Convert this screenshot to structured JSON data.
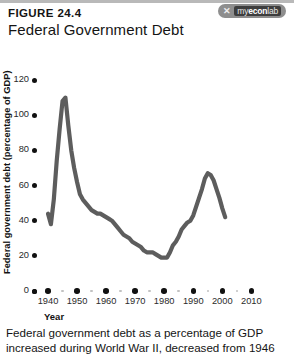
{
  "header": {
    "figure_number": "FIGURE 24.4",
    "title": "Federal Government Debt",
    "logo_mark": "✕",
    "logo_my": "my",
    "logo_econ": "econ",
    "logo_lab": "lab"
  },
  "caption": {
    "line1": "Federal government debt as a percentage of GDP",
    "line2": "increased during World War II, decreased from 1946"
  },
  "chart_data": {
    "type": "line",
    "title": "Federal Government Debt",
    "xlabel": "Year",
    "ylabel": "Federal government debt (percentage of GDP)",
    "xlim": [
      1940,
      2010
    ],
    "ylim": [
      0,
      120
    ],
    "xticks": [
      "1940",
      "1950",
      "1960",
      "1970",
      "1980",
      "1990",
      "2000",
      "2010"
    ],
    "yticks": [
      "0",
      "20",
      "40",
      "60",
      "80",
      "100",
      "120"
    ],
    "grid": false,
    "legend": "none",
    "line_color": "#5d5d5d",
    "series": [
      {
        "name": "Federal government debt (percentage of GDP)",
        "x": [
          1940,
          1941,
          1942,
          1943,
          1944,
          1945,
          1946,
          1947,
          1948,
          1949,
          1950,
          1951,
          1952,
          1953,
          1954,
          1955,
          1956,
          1957,
          1958,
          1959,
          1960,
          1961,
          1962,
          1963,
          1964,
          1965,
          1966,
          1967,
          1968,
          1969,
          1970,
          1971,
          1972,
          1973,
          1974,
          1975,
          1976,
          1977,
          1978,
          1979,
          1980,
          1981,
          1982,
          1983,
          1984,
          1985,
          1986,
          1987,
          1988,
          1989,
          1990,
          1991,
          1992,
          1993,
          1994,
          1995,
          1996,
          1997,
          1998,
          1999,
          2000,
          2001
        ],
        "values": [
          44,
          38,
          52,
          74,
          92,
          108,
          110,
          94,
          80,
          70,
          62,
          55,
          52,
          50,
          48,
          46,
          45,
          44,
          44,
          43,
          42,
          41,
          40,
          38,
          36,
          34,
          32,
          31,
          30,
          28,
          27,
          26,
          25,
          23,
          22,
          22,
          22,
          21,
          20,
          19,
          19,
          19,
          22,
          26,
          28,
          31,
          35,
          37,
          39,
          40,
          43,
          48,
          53,
          58,
          64,
          67,
          66,
          63,
          58,
          53,
          47,
          42
        ]
      }
    ]
  }
}
